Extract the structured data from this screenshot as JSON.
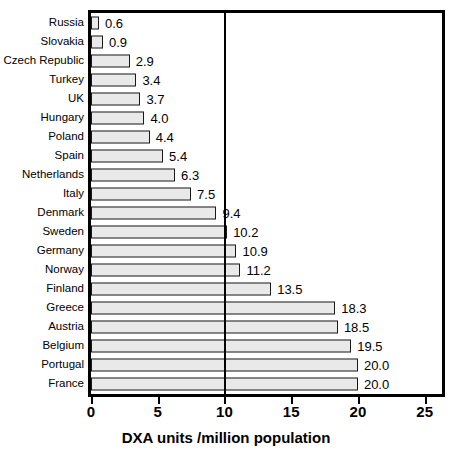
{
  "chart_data": {
    "type": "bar",
    "orientation": "horizontal",
    "title": "",
    "xlabel": "DXA units /million population",
    "ylabel": "",
    "xlim": [
      0,
      26.3
    ],
    "xticks": [
      0,
      5,
      10,
      15,
      20,
      25
    ],
    "xtick_labels": [
      "0",
      "5",
      "10",
      "15",
      "20",
      "25"
    ],
    "grid": true,
    "gridlines": [
      10
    ],
    "legend": null,
    "categories": [
      "Russia",
      "Slovakia",
      "Czech Republic",
      "Turkey",
      "UK",
      "Hungary",
      "Poland",
      "Spain",
      "Netherlands",
      "Italy",
      "Denmark",
      "Sweden",
      "Germany",
      "Norway",
      "Finland",
      "Greece",
      "Austria",
      "Belgium",
      "Portugal",
      "France"
    ],
    "values": [
      0.6,
      0.9,
      2.9,
      3.4,
      3.7,
      4.0,
      4.4,
      5.4,
      6.3,
      7.5,
      9.4,
      10.2,
      10.9,
      11.2,
      13.5,
      18.3,
      18.5,
      19.5,
      20.0,
      20.0
    ],
    "value_labels": [
      "0.6",
      "0.9",
      "2.9",
      "3.4",
      "3.7",
      "4.0",
      "4.4",
      "5.4",
      "6.3",
      "7.5",
      "9.4",
      "10.2",
      "10.9",
      "11.2",
      "13.5",
      "18.3",
      "18.5",
      "19.5",
      "20.0",
      "20.0"
    ],
    "bar_fill_color": "#e9e9e9",
    "bar_edge_color": "#1a1a1a",
    "axis_color": "#000000"
  }
}
